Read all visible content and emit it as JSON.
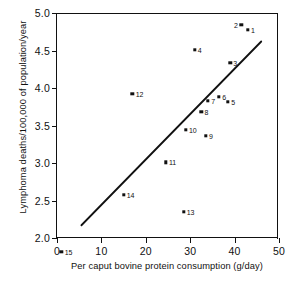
{
  "chart_data": {
    "type": "scatter",
    "title": "",
    "xlabel": "Per caput bovine protein consumption (g/day)",
    "ylabel": "Lymphoma deaths/100,000 of population/year",
    "xlim": [
      0,
      50
    ],
    "ylim": [
      2.0,
      5.0
    ],
    "grid": false,
    "legend": "none",
    "xticks": [
      "0",
      "10",
      "20",
      "30",
      "40",
      "50"
    ],
    "xtick_values": [
      0,
      10,
      20,
      30,
      40,
      50
    ],
    "yticks": [
      "2.0",
      "2.5",
      "3.0",
      "3.5",
      "4.0",
      "4.5",
      "5.0"
    ],
    "ytick_values": [
      2.0,
      2.5,
      3.0,
      3.5,
      4.0,
      4.5,
      5.0
    ],
    "points": [
      {
        "label": "1",
        "x": 43.0,
        "y": 4.78,
        "label_side": "right"
      },
      {
        "label": "2",
        "x": 41.5,
        "y": 4.84,
        "label_side": "left"
      },
      {
        "label": "3",
        "x": 39.0,
        "y": 4.34,
        "label_side": "right"
      },
      {
        "label": "4",
        "x": 31.0,
        "y": 4.51,
        "label_side": "right"
      },
      {
        "label": "5",
        "x": 38.5,
        "y": 3.82,
        "label_side": "right"
      },
      {
        "label": "6",
        "x": 36.5,
        "y": 3.88,
        "label_side": "right"
      },
      {
        "label": "7",
        "x": 34.0,
        "y": 3.83,
        "label_side": "right"
      },
      {
        "label": "8",
        "x": 32.5,
        "y": 3.68,
        "label_side": "right"
      },
      {
        "label": "9",
        "x": 33.5,
        "y": 3.36,
        "label_side": "right"
      },
      {
        "label": "10",
        "x": 29.0,
        "y": 3.44,
        "label_side": "right"
      },
      {
        "label": "11",
        "x": 24.5,
        "y": 3.01,
        "label_side": "right"
      },
      {
        "label": "12",
        "x": 17.0,
        "y": 3.92,
        "label_side": "right"
      },
      {
        "label": "13",
        "x": 28.5,
        "y": 2.35,
        "label_side": "right"
      },
      {
        "label": "14",
        "x": 15.0,
        "y": 2.58,
        "label_side": "right"
      },
      {
        "label": "15",
        "x": 1.0,
        "y": 1.82,
        "label_side": "right"
      }
    ],
    "trendline": {
      "type": "line",
      "x0": 5.5,
      "y0": 2.17,
      "x1": 46.0,
      "y1": 4.62
    },
    "colors": {
      "point": "#111111",
      "line": "#111111",
      "axis": "#111111",
      "background": "#ffffff"
    }
  }
}
